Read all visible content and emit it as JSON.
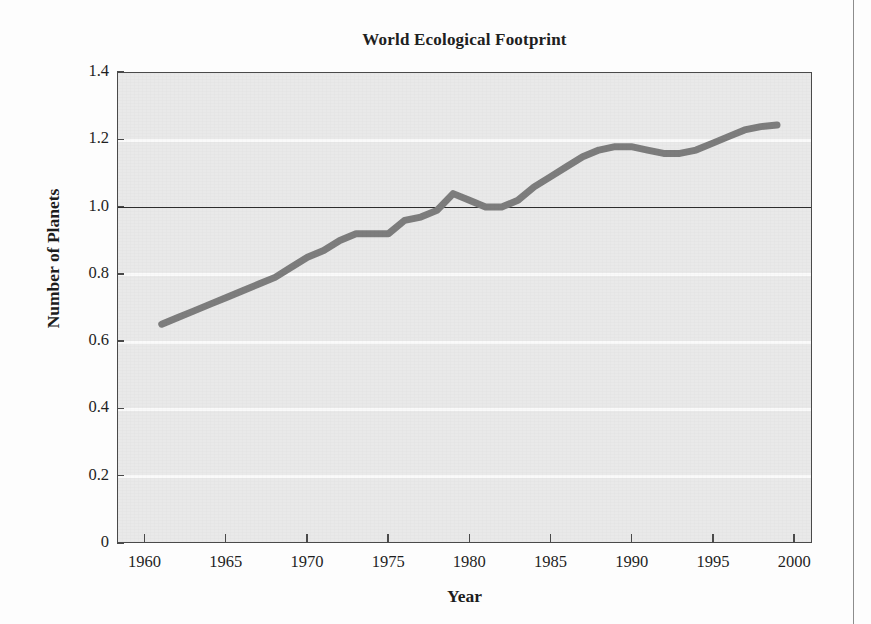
{
  "figure": {
    "title": "World Ecological Footprint"
  },
  "chart_data": {
    "type": "line",
    "title": "World Ecological Footprint",
    "xlabel": "Year",
    "ylabel": "Number of Planets",
    "xlim": [
      1958.3,
      2001.1
    ],
    "ylim": [
      0,
      1.4
    ],
    "grid": true,
    "legend": "none",
    "reference_line": {
      "value": 1.0,
      "color": "#2d2d2d",
      "label": ""
    },
    "line_color": "#7d7d7d",
    "line_width": 7,
    "x_ticks": [
      1960,
      1965,
      1970,
      1975,
      1980,
      1985,
      1990,
      1995,
      2000
    ],
    "x_tick_labels": [
      "1960",
      "1965",
      "1970",
      "1975",
      "1980",
      "1985",
      "1990",
      "1995",
      "2000"
    ],
    "y_ticks": [
      0,
      0.2,
      0.4,
      0.6,
      0.8,
      1.0,
      1.2,
      1.4
    ],
    "y_tick_labels": [
      "0",
      "0.2",
      "0.4",
      "0.6",
      "0.8",
      "1.0",
      "1.2",
      "1.4"
    ],
    "series": [
      {
        "name": "World Ecological Footprint",
        "x": [
          1961,
          1962,
          1963,
          1964,
          1965,
          1966,
          1967,
          1968,
          1969,
          1970,
          1971,
          1972,
          1973,
          1974,
          1975,
          1976,
          1977,
          1978,
          1979,
          1980,
          1981,
          1982,
          1983,
          1984,
          1985,
          1986,
          1987,
          1988,
          1989,
          1990,
          1991,
          1992,
          1993,
          1994,
          1995,
          1996,
          1997,
          1998,
          1999
        ],
        "values": [
          0.65,
          0.67,
          0.69,
          0.71,
          0.73,
          0.75,
          0.77,
          0.79,
          0.82,
          0.85,
          0.87,
          0.9,
          0.92,
          0.92,
          0.92,
          0.96,
          0.97,
          0.99,
          1.04,
          1.02,
          1.0,
          1.0,
          1.02,
          1.06,
          1.09,
          1.12,
          1.15,
          1.17,
          1.18,
          1.18,
          1.17,
          1.16,
          1.16,
          1.17,
          1.19,
          1.21,
          1.23,
          1.24,
          1.245
        ]
      }
    ]
  },
  "axes": {
    "y_label": "Number of Planets",
    "x_label": "Year"
  }
}
